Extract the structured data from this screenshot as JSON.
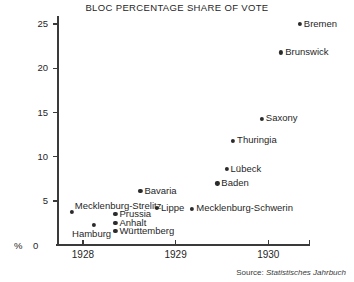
{
  "chart_data": {
    "type": "scatter",
    "title": "BLOC PERCENTAGE SHARE OF VOTE",
    "xlabel": "",
    "ylabel": "%",
    "xlim": [
      1927.72,
      1930.45
    ],
    "ylim": [
      0,
      25.7
    ],
    "grid": false,
    "legend": null,
    "xticks": [
      "1928",
      "1929",
      "1930"
    ],
    "xtick_values": [
      1928,
      1929,
      1930
    ],
    "yticks": [
      "0",
      "5",
      "10",
      "15",
      "20",
      "25"
    ],
    "ytick_values": [
      0,
      5,
      10,
      15,
      20,
      25
    ],
    "source": "Source:",
    "source_title": "Statistisches Jahrbuch",
    "points": [
      {
        "label": "Bremen",
        "x": 1930.34,
        "y": 25.0,
        "label_pos": "right"
      },
      {
        "label": "Brunswick",
        "x": 1930.14,
        "y": 21.8,
        "label_pos": "right"
      },
      {
        "label": "Saxony",
        "x": 1929.93,
        "y": 14.3,
        "label_pos": "right"
      },
      {
        "label": "Thuringia",
        "x": 1929.62,
        "y": 11.8,
        "label_pos": "right"
      },
      {
        "label": "Lübeck",
        "x": 1929.55,
        "y": 8.6,
        "label_pos": "right"
      },
      {
        "label": "Baden",
        "x": 1929.45,
        "y": 7.0,
        "label_pos": "right"
      },
      {
        "label": "Bavaria",
        "x": 1928.62,
        "y": 6.1,
        "label_pos": "right"
      },
      {
        "label": "Mecklenburg-Strelitz",
        "x": 1927.88,
        "y": 3.8,
        "label_pos": "above-right"
      },
      {
        "label": "Mecklenburg-Schwerin",
        "x": 1929.18,
        "y": 4.1,
        "label_pos": "right"
      },
      {
        "label": "Lippe",
        "x": 1928.8,
        "y": 4.2,
        "label_pos": "right"
      },
      {
        "label": "Prussia",
        "x": 1928.35,
        "y": 3.5,
        "label_pos": "right"
      },
      {
        "label": "Anhalt",
        "x": 1928.35,
        "y": 2.5,
        "label_pos": "right"
      },
      {
        "label": "Württemberg",
        "x": 1928.35,
        "y": 1.6,
        "label_pos": "right"
      },
      {
        "label": "Hamburg",
        "x": 1928.12,
        "y": 2.3,
        "label_pos": "below"
      }
    ]
  }
}
